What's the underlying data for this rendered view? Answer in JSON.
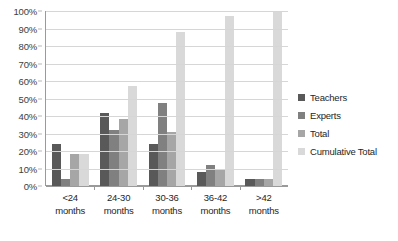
{
  "chart_data": {
    "type": "bar",
    "title": "",
    "subtitle": "",
    "xlabel": "",
    "ylabel": "",
    "ylim": [
      0,
      100
    ],
    "y_ticks": [
      "0%",
      "10%",
      "20%",
      "30%",
      "40%",
      "50%",
      "60%",
      "70%",
      "80%",
      "90%",
      "100%"
    ],
    "y_tick_values": [
      0,
      10,
      20,
      30,
      40,
      50,
      60,
      70,
      80,
      90,
      100
    ],
    "grid": true,
    "legend_position": "right",
    "categories": [
      "<24 months",
      "24-30 months",
      "30-36 months",
      "36-42 months",
      ">42 months"
    ],
    "category_lines": [
      [
        "<24",
        "months"
      ],
      [
        "24-30",
        "months"
      ],
      [
        "30-36",
        "months"
      ],
      [
        "36-42",
        "months"
      ],
      [
        ">42",
        "months"
      ]
    ],
    "series": [
      {
        "name": "Teachers",
        "color": "#595959",
        "values": [
          24,
          41.5,
          24,
          8,
          4
        ]
      },
      {
        "name": "Experts",
        "color": "#808080",
        "values": [
          4,
          32,
          47.5,
          12,
          4
        ]
      },
      {
        "name": "Total",
        "color": "#a6a6a6",
        "values": [
          18.5,
          38.5,
          31,
          9,
          4
        ]
      },
      {
        "name": "Cumulative Total",
        "color": "#d9d9d9",
        "values": [
          18.5,
          57,
          88,
          97,
          100
        ]
      }
    ]
  },
  "legend": {
    "items": [
      {
        "label": "Teachers"
      },
      {
        "label": "Experts"
      },
      {
        "label": "Total"
      },
      {
        "label": "Cumulative Total"
      }
    ]
  }
}
